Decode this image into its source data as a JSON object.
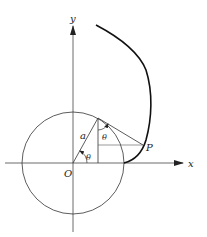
{
  "diagram": {
    "type": "involute-of-circle",
    "labels": {
      "x_axis": "x",
      "y_axis": "y",
      "origin": "O",
      "point": "P",
      "radius": "a",
      "angle_center": "θ",
      "angle_tangent": "θ"
    },
    "colors": {
      "stroke": "#222222",
      "curve": "#111111",
      "background": "#ffffff"
    }
  }
}
